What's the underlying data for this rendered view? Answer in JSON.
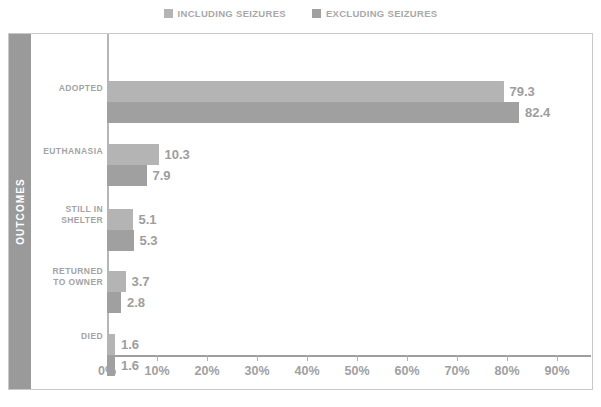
{
  "legend": {
    "position": "top-center",
    "entries": [
      {
        "label": "INCLUDING SEIZURES",
        "color": "#b4b4b4",
        "swatch_icon": "square-swatch-icon"
      },
      {
        "label": "EXCLUDING SEIZURES",
        "color": "#a0a0a0",
        "swatch_icon": "square-swatch-icon"
      }
    ]
  },
  "axis": {
    "y_title": "OUTCOMES",
    "x_ticks": [
      "0%",
      "10%",
      "20%",
      "30%",
      "40%",
      "50%",
      "60%",
      "70%",
      "80%",
      "90%"
    ]
  },
  "categories": [
    {
      "line1": "ADOPTED",
      "line2": ""
    },
    {
      "line1": "EUTHANASIA",
      "line2": ""
    },
    {
      "line1": "STILL IN",
      "line2": "SHELTER"
    },
    {
      "line1": "RETURNED",
      "line2": "TO OWNER"
    },
    {
      "line1": "DIED",
      "line2": ""
    }
  ],
  "values": {
    "including": [
      "79.3",
      "10.3",
      "5.1",
      "3.7",
      "1.6"
    ],
    "excluding": [
      "82.4",
      "7.9",
      "5.3",
      "2.8",
      "1.6"
    ]
  },
  "chart_data": {
    "type": "bar",
    "orientation": "horizontal",
    "title": "",
    "subtitle": "",
    "xlabel": "",
    "ylabel": "OUTCOMES",
    "categories": [
      "ADOPTED",
      "EUTHANASIA",
      "STILL IN SHELTER",
      "RETURNED TO OWNER",
      "DIED"
    ],
    "series": [
      {
        "name": "INCLUDING SEIZURES",
        "color": "#b4b4b4",
        "values": [
          79.3,
          10.3,
          5.1,
          3.7,
          1.6
        ]
      },
      {
        "name": "EXCLUDING SEIZURES",
        "color": "#a0a0a0",
        "values": [
          82.4,
          7.9,
          5.3,
          2.8,
          1.6
        ]
      }
    ],
    "xlim": [
      0,
      90
    ],
    "xtick_values": [
      0,
      10,
      20,
      30,
      40,
      50,
      60,
      70,
      80,
      90
    ],
    "xtick_labels": [
      "0%",
      "10%",
      "20%",
      "30%",
      "40%",
      "50%",
      "60%",
      "70%",
      "80%",
      "90%"
    ],
    "xtick_format": "percent",
    "grid": false,
    "data_labels": true,
    "legend_position": "top-center"
  }
}
